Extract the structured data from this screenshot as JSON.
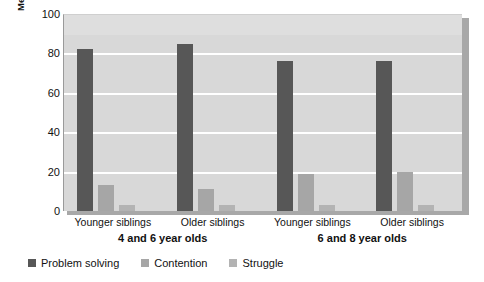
{
  "chart_data": {
    "type": "bar",
    "title": "",
    "subtitle": "",
    "xlabel": "",
    "ylabel": "Mean percentage of negotiation strategies",
    "ylim": [
      0,
      100
    ],
    "yticks": [
      0,
      20,
      40,
      60,
      80,
      100
    ],
    "grid": true,
    "legend_position": "bottom-left",
    "categories": [
      "Younger siblings",
      "Older siblings",
      "Younger siblings",
      "Older siblings"
    ],
    "group_labels": [
      {
        "label": "4 and 6 year olds",
        "categories": [
          0,
          1
        ]
      },
      {
        "label": "6 and 8 year olds",
        "categories": [
          2,
          3
        ]
      }
    ],
    "series": [
      {
        "name": "Problem solving",
        "color": "#575757",
        "values": [
          82,
          85,
          76,
          76
        ]
      },
      {
        "name": "Contention",
        "color": "#a6a6a6",
        "values": [
          13,
          11,
          19,
          20
        ]
      },
      {
        "name": "Struggle",
        "color": "#b3b3b3",
        "values": [
          3,
          3,
          3,
          3
        ]
      }
    ]
  },
  "axis": {
    "y_title": "Mean percentage of negotiation strategies",
    "y_tick_labels": [
      "100",
      "80",
      "60",
      "40",
      "20",
      "0"
    ]
  },
  "colors": {
    "plot_background": "#d8d8d8",
    "gridline": "#ffffff",
    "page_background": "#ffffff",
    "shadow": "#a8a8a8",
    "text": "#111111"
  }
}
